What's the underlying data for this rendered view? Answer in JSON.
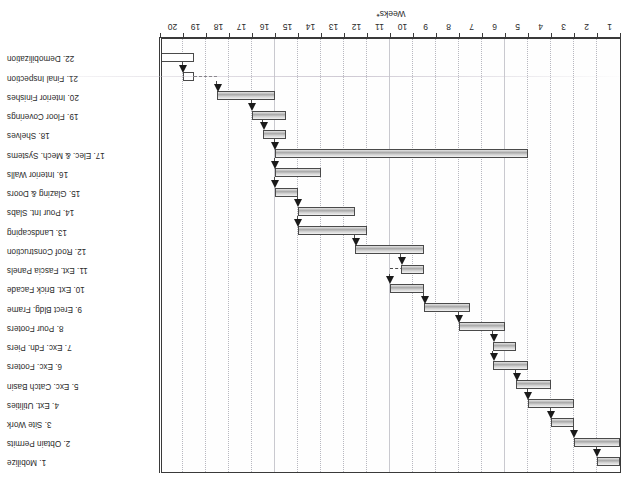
{
  "figure": {
    "rotation_degrees": 180,
    "axis_title": "Weeks*",
    "frame_color": "#3a3a3a",
    "bar_fill": "#bfbfbf",
    "bar_border": "#4a4a4a",
    "grid_color": "#c9c9cf"
  },
  "chart_data": {
    "type": "bar",
    "subtype": "gantt",
    "title": "",
    "xlabel": "Weeks*",
    "ylabel": "",
    "xlim": [
      0,
      20
    ],
    "grid": true,
    "legend": "none",
    "x_tick_labels": [
      "1",
      "2",
      "3",
      "4",
      "5",
      "6",
      "7",
      "8",
      "9",
      "10",
      "11",
      "12",
      "13",
      "14",
      "15",
      "16",
      "17",
      "18",
      "19",
      "20"
    ],
    "categories": [
      "1. Mobilize",
      "2. Obtain Permits",
      "3. Site Work",
      "4. Ext. Utilities",
      "5. Exc. Catch Basin",
      "6. Exc. Footers",
      "7. Exc. Fdn. Piers",
      "8. Pour Footers",
      "9. Erect Bldg. Frame",
      "10. Ext. Brick Facade",
      "11. Ext. Fascia Panels",
      "12. Roof Construction",
      "13. Landscaping",
      "14. Pour Int. Slabs",
      "15. Glazing & Doors",
      "16. Interior Walls",
      "17. Elec. & Mech. Systems",
      "18. Shelves",
      "19. Floor Coverings",
      "20. Interior Finishes",
      "21. Final Inspection",
      "22. Demobilization"
    ],
    "tasks": [
      {
        "id": 1,
        "name": "1. Mobilize",
        "start": 0.0,
        "end": 1.0,
        "style": "filled"
      },
      {
        "id": 2,
        "name": "2. Obtain Permits",
        "start": 0.0,
        "end": 2.0,
        "style": "filled"
      },
      {
        "id": 3,
        "name": "3. Site Work",
        "start": 2.0,
        "end": 3.0,
        "style": "filled"
      },
      {
        "id": 4,
        "name": "4. Ext. Utilities",
        "start": 2.0,
        "end": 4.0,
        "style": "filled"
      },
      {
        "id": 5,
        "name": "5. Exc. Catch Basin",
        "start": 3.0,
        "end": 4.5,
        "style": "filled"
      },
      {
        "id": 6,
        "name": "6. Exc. Footers",
        "start": 4.0,
        "end": 5.5,
        "style": "filled"
      },
      {
        "id": 7,
        "name": "7. Exc. Fdn. Piers",
        "start": 4.5,
        "end": 5.5,
        "style": "filled"
      },
      {
        "id": 8,
        "name": "8. Pour Footers",
        "start": 5.0,
        "end": 7.0,
        "style": "filled"
      },
      {
        "id": 9,
        "name": "9. Erect Bldg. Frame",
        "start": 6.5,
        "end": 8.5,
        "style": "filled"
      },
      {
        "id": 10,
        "name": "10. Ext. Brick Facade",
        "start": 8.5,
        "end": 10.0,
        "style": "filled"
      },
      {
        "id": 11,
        "name": "11. Ext. Fascia Panels",
        "start": 8.5,
        "end": 9.5,
        "style": "filled"
      },
      {
        "id": 12,
        "name": "12. Roof Construction",
        "start": 8.5,
        "end": 11.5,
        "style": "filled"
      },
      {
        "id": 13,
        "name": "13. Landscaping",
        "start": 11.0,
        "end": 14.0,
        "style": "filled"
      },
      {
        "id": 14,
        "name": "14. Pour Int. Slabs",
        "start": 11.5,
        "end": 14.0,
        "style": "filled"
      },
      {
        "id": 15,
        "name": "15. Glazing & Doors",
        "start": 14.0,
        "end": 15.0,
        "style": "filled"
      },
      {
        "id": 16,
        "name": "16. Interior Walls",
        "start": 13.0,
        "end": 15.0,
        "style": "filled"
      },
      {
        "id": 17,
        "name": "17. Elec. & Mech. Systems",
        "start": 4.0,
        "end": 15.0,
        "style": "filled"
      },
      {
        "id": 18,
        "name": "18. Shelves",
        "start": 14.5,
        "end": 15.5,
        "style": "filled"
      },
      {
        "id": 19,
        "name": "19. Floor Coverings",
        "start": 14.5,
        "end": 16.0,
        "style": "filled"
      },
      {
        "id": 20,
        "name": "20. Interior Finishes",
        "start": 15.0,
        "end": 17.5,
        "style": "filled"
      },
      {
        "id": 21,
        "name": "21. Final Inspection",
        "start": 18.5,
        "end": 19.0,
        "style": "hollow"
      },
      {
        "id": 22,
        "name": "22. Demobilization",
        "start": 18.5,
        "end": 20.0,
        "style": "hollow"
      }
    ],
    "milestone_count": 21
  }
}
